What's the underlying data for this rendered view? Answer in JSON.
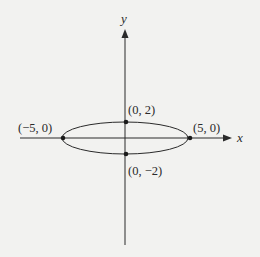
{
  "axes": {
    "x_label": "x",
    "y_label": "y"
  },
  "points": [
    {
      "id": "vertex-left",
      "label": "(−5, 0)",
      "x": -5,
      "y": 0
    },
    {
      "id": "vertex-right",
      "label": "(5, 0)",
      "x": 5,
      "y": 0
    },
    {
      "id": "covertex-top",
      "label": "(0, 2)",
      "x": 0,
      "y": 2
    },
    {
      "id": "covertex-bottom",
      "label": "(0, −2)",
      "x": 0,
      "y": -2
    }
  ],
  "ellipse": {
    "center": [
      0,
      0
    ],
    "semi_major_axis": 5,
    "semi_minor_axis": 2,
    "equation": "x^2/25 + y^2/4 = 1"
  },
  "colors": {
    "background": "#f2f2f0",
    "ink": "#2a2a2a"
  }
}
